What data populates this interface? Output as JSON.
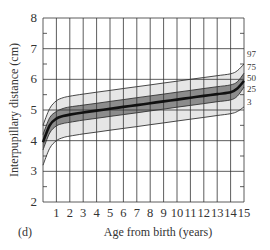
{
  "chart_data": {
    "type": "line",
    "title": "",
    "panel_label": "(d)",
    "xlabel": "Age from birth (years)",
    "ylabel": "Interpupillary distance (cm)",
    "xlim": [
      0,
      15
    ],
    "ylim": [
      2,
      8
    ],
    "grid": true,
    "x_ticks": [
      1,
      2,
      3,
      4,
      5,
      6,
      7,
      8,
      9,
      10,
      11,
      12,
      13,
      14,
      15
    ],
    "y_ticks": [
      2,
      3,
      4,
      5,
      6,
      7,
      8
    ],
    "x": [
      0,
      0.5,
      1,
      1.5,
      2,
      3,
      4,
      5,
      6,
      7,
      8,
      9,
      10,
      11,
      12,
      13,
      14,
      14.5,
      15
    ],
    "series": [
      {
        "name": "97",
        "values": [
          4.5,
          5.05,
          5.3,
          5.4,
          5.45,
          5.52,
          5.58,
          5.64,
          5.7,
          5.76,
          5.82,
          5.88,
          5.94,
          6.0,
          6.06,
          6.12,
          6.18,
          6.28,
          6.5
        ]
      },
      {
        "name": "75",
        "values": [
          4.2,
          4.75,
          4.95,
          5.05,
          5.1,
          5.16,
          5.22,
          5.28,
          5.34,
          5.4,
          5.46,
          5.52,
          5.58,
          5.64,
          5.7,
          5.76,
          5.82,
          5.92,
          6.2
        ]
      },
      {
        "name": "50",
        "values": [
          3.95,
          4.5,
          4.72,
          4.8,
          4.85,
          4.92,
          4.98,
          5.04,
          5.1,
          5.16,
          5.22,
          5.28,
          5.34,
          5.4,
          5.46,
          5.52,
          5.58,
          5.7,
          5.95
        ]
      },
      {
        "name": "25",
        "values": [
          3.7,
          4.25,
          4.48,
          4.56,
          4.6,
          4.67,
          4.73,
          4.79,
          4.85,
          4.91,
          4.97,
          5.03,
          5.09,
          5.15,
          5.21,
          5.27,
          5.33,
          5.45,
          5.75
        ]
      },
      {
        "name": "3",
        "values": [
          3.2,
          3.75,
          4.0,
          4.1,
          4.15,
          4.22,
          4.28,
          4.34,
          4.4,
          4.46,
          4.52,
          4.58,
          4.64,
          4.7,
          4.76,
          4.82,
          4.88,
          4.95,
          5.1
        ]
      }
    ],
    "legend_position": "right-end labels",
    "shading": {
      "outer_band": "3-97 light grey",
      "inner_band": "25-75 dark grey"
    }
  },
  "labels": {
    "panel": "(d)",
    "xlabel": "Age from birth (years)",
    "ylabel": "Interpupillary distance (cm)"
  },
  "colors": {
    "outer_band": "#e6e6e6",
    "inner_band": "#8c8c8c",
    "median": "#111111",
    "grid": "#333333"
  }
}
